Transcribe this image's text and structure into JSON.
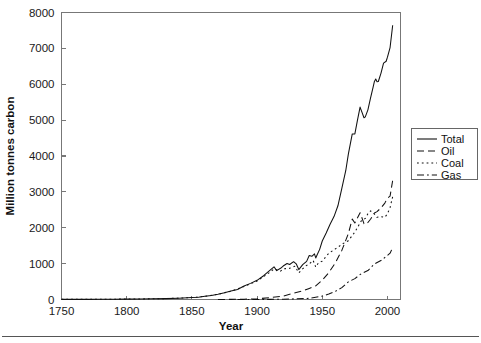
{
  "figure": {
    "width": 481,
    "height": 343,
    "background": "#ffffff",
    "ink_color": "#111111",
    "axis_color": "#777777",
    "footer_rule": true
  },
  "chart_data": {
    "type": "line",
    "title": "",
    "xlabel": "Year",
    "ylabel": "Million tonnes carbon",
    "xlim": [
      1750,
      2010
    ],
    "ylim": [
      0,
      8000
    ],
    "xticks": [
      1750,
      1800,
      1850,
      1900,
      1950,
      2000
    ],
    "xticklabels": [
      "1750",
      "1800",
      "1850",
      "1900",
      "1950",
      "2000"
    ],
    "yticks": [
      0,
      1000,
      2000,
      3000,
      4000,
      5000,
      6000,
      7000,
      8000
    ],
    "yticklabels": [
      "0",
      "1000",
      "2000",
      "3000",
      "4000",
      "5000",
      "6000",
      "7000",
      "8000"
    ],
    "grid": false,
    "legend_position": "right-outside",
    "tick_direction": "in",
    "series": [
      {
        "name": "Total",
        "style": "solid",
        "dash": "none",
        "x": [
          1750,
          1760,
          1770,
          1780,
          1790,
          1800,
          1810,
          1820,
          1830,
          1840,
          1850,
          1855,
          1860,
          1865,
          1870,
          1875,
          1880,
          1885,
          1890,
          1895,
          1900,
          1905,
          1910,
          1913,
          1915,
          1918,
          1920,
          1923,
          1925,
          1928,
          1930,
          1932,
          1935,
          1938,
          1940,
          1942,
          1944,
          1945,
          1946,
          1948,
          1950,
          1953,
          1956,
          1959,
          1962,
          1965,
          1968,
          1970,
          1973,
          1975,
          1977,
          1979,
          1980,
          1982,
          1983,
          1985,
          1987,
          1989,
          1990,
          1991,
          1992,
          1993,
          1995,
          1997,
          1999,
          2000,
          2002,
          2004
        ],
        "values": [
          3,
          3,
          4,
          5,
          8,
          11,
          15,
          19,
          24,
          36,
          54,
          64,
          91,
          113,
          147,
          187,
          236,
          281,
          374,
          450,
          534,
          663,
          819,
          911,
          805,
          870,
          932,
          1004,
          975,
          1054,
          994,
          834,
          971,
          1063,
          1225,
          1205,
          1272,
          1159,
          1238,
          1398,
          1630,
          1855,
          2096,
          2311,
          2613,
          3095,
          3590,
          4053,
          4614,
          4615,
          4998,
          5363,
          5264,
          5066,
          5092,
          5286,
          5611,
          5923,
          6077,
          6144,
          6071,
          6076,
          6305,
          6588,
          6641,
          6755,
          7023,
          7646
        ]
      },
      {
        "name": "Oil",
        "style": "dashed",
        "dash": "7,4",
        "x": [
          1870,
          1880,
          1890,
          1900,
          1910,
          1920,
          1925,
          1930,
          1935,
          1940,
          1945,
          1950,
          1955,
          1960,
          1965,
          1970,
          1973,
          1975,
          1979,
          1980,
          1982,
          1983,
          1985,
          1987,
          1990,
          1992,
          1995,
          1998,
          2000,
          2002,
          2004
        ],
        "values": [
          1,
          4,
          9,
          18,
          52,
          96,
          145,
          197,
          237,
          309,
          379,
          541,
          749,
          1017,
          1368,
          1838,
          2241,
          2134,
          2419,
          2319,
          2113,
          2096,
          2147,
          2238,
          2410,
          2450,
          2552,
          2688,
          2828,
          2880,
          3319
        ]
      },
      {
        "name": "Coal",
        "style": "dotted",
        "dash": "1.8,3",
        "x": [
          1750,
          1800,
          1830,
          1850,
          1860,
          1870,
          1880,
          1890,
          1900,
          1910,
          1913,
          1918,
          1920,
          1925,
          1929,
          1932,
          1937,
          1940,
          1943,
          1945,
          1947,
          1950,
          1955,
          1960,
          1963,
          1965,
          1970,
          1975,
          1980,
          1983,
          1985,
          1987,
          1990,
          1992,
          1995,
          1998,
          2000,
          2002,
          2004
        ],
        "values": [
          3,
          11,
          24,
          53,
          90,
          146,
          231,
          364,
          515,
          765,
          853,
          789,
          853,
          870,
          929,
          742,
          928,
          990,
          1090,
          902,
          1017,
          1070,
          1290,
          1410,
          1483,
          1542,
          1640,
          1880,
          2195,
          2260,
          2390,
          2470,
          2380,
          2290,
          2310,
          2290,
          2390,
          2560,
          2870
        ]
      },
      {
        "name": "Gas",
        "style": "dashdot",
        "dash": "7,3,1.8,3",
        "x": [
          1885,
          1900,
          1910,
          1920,
          1930,
          1940,
          1950,
          1955,
          1960,
          1965,
          1970,
          1975,
          1980,
          1985,
          1990,
          1995,
          2000,
          2002,
          2004
        ],
        "values": [
          1,
          2,
          4,
          8,
          19,
          32,
          97,
          153,
          227,
          332,
          493,
          582,
          723,
          806,
          990,
          1085,
          1228,
          1290,
          1450
        ]
      }
    ],
    "annotations": []
  },
  "legend": {
    "entries": [
      {
        "label": "Total",
        "style": "solid"
      },
      {
        "label": "Oil",
        "style": "dashed"
      },
      {
        "label": "Coal",
        "style": "dotted"
      },
      {
        "label": "Gas",
        "style": "dashdot"
      }
    ]
  }
}
